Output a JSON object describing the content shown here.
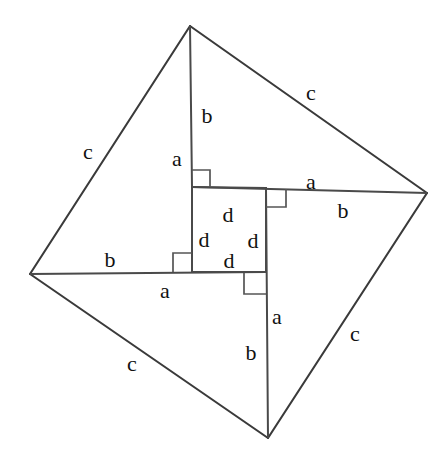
{
  "figure": {
    "stroke_color": "#3a3a3a",
    "background_color": "#ffffff",
    "canvas": {
      "width": 448,
      "height": 466
    }
  },
  "vertices": {
    "top": {
      "x": 190,
      "y": 26
    },
    "right": {
      "x": 427,
      "y": 193
    },
    "bottom": {
      "x": 268,
      "y": 438
    },
    "left": {
      "x": 30,
      "y": 274
    }
  },
  "inner_square": {
    "top_left": {
      "x": 192,
      "y": 187
    },
    "top_right": {
      "x": 266,
      "y": 188
    },
    "bottom_right": {
      "x": 266,
      "y": 272
    },
    "bottom_left": {
      "x": 192,
      "y": 272
    }
  },
  "edges": [
    {
      "name": "outer-top-left",
      "from": "top",
      "to": "left"
    },
    {
      "name": "outer-top-right",
      "from": "top",
      "to": "right"
    },
    {
      "name": "outer-bottom-right",
      "from": "right",
      "to": "bottom"
    },
    {
      "name": "outer-bottom-left",
      "from": "bottom",
      "to": "left"
    },
    {
      "name": "cevian-top",
      "from": "top",
      "to": "inner_square.top_left"
    },
    {
      "name": "cevian-right",
      "from": "right",
      "to": "inner_square.top_right"
    },
    {
      "name": "cevian-bottom",
      "from": "bottom",
      "to": "inner_square.bottom_right"
    },
    {
      "name": "cevian-left",
      "from": "left",
      "to": "inner_square.bottom_left"
    }
  ],
  "labels": [
    {
      "id": "c-top-right",
      "text": "c",
      "x": 311,
      "y": 93
    },
    {
      "id": "c-top-left",
      "text": "c",
      "x": 88,
      "y": 152
    },
    {
      "id": "c-bottom-left",
      "text": "c",
      "x": 132,
      "y": 364
    },
    {
      "id": "c-bottom-right",
      "text": "c",
      "x": 355,
      "y": 334
    },
    {
      "id": "b-upper",
      "text": "b",
      "x": 207,
      "y": 116
    },
    {
      "id": "a-upper",
      "text": "a",
      "x": 177,
      "y": 159
    },
    {
      "id": "a-right",
      "text": "a",
      "x": 311,
      "y": 182
    },
    {
      "id": "b-right",
      "text": "b",
      "x": 343,
      "y": 211
    },
    {
      "id": "b-left",
      "text": "b",
      "x": 110,
      "y": 260
    },
    {
      "id": "a-left",
      "text": "a",
      "x": 165,
      "y": 291
    },
    {
      "id": "a-lower",
      "text": "a",
      "x": 277,
      "y": 317
    },
    {
      "id": "b-lower",
      "text": "b",
      "x": 251,
      "y": 353
    },
    {
      "id": "d-top",
      "text": "d",
      "x": 228,
      "y": 215
    },
    {
      "id": "d-left",
      "text": "d",
      "x": 204,
      "y": 240
    },
    {
      "id": "d-right",
      "text": "d",
      "x": 253,
      "y": 241
    },
    {
      "id": "d-bottom",
      "text": "d",
      "x": 229,
      "y": 261
    }
  ],
  "right_angle_markers": [
    {
      "id": "angle-top-left-inner",
      "x": 192,
      "y": 172,
      "size": 17,
      "dx": 1,
      "dy": 1
    },
    {
      "id": "angle-top-right-inner",
      "x": 266,
      "y": 188,
      "size": 19,
      "dx": 1,
      "dy": 1
    },
    {
      "id": "angle-bottom-left-inner",
      "x": 192,
      "y": 253,
      "size": 18,
      "dx": -1,
      "dy": 1
    },
    {
      "id": "angle-bottom-right-inner",
      "x": 244,
      "y": 273,
      "size": 21,
      "dx": 1,
      "dy": 1
    }
  ],
  "legend": {
    "a_meaning": "a",
    "b_meaning": "b",
    "c_meaning": "c",
    "d_meaning": "d"
  }
}
